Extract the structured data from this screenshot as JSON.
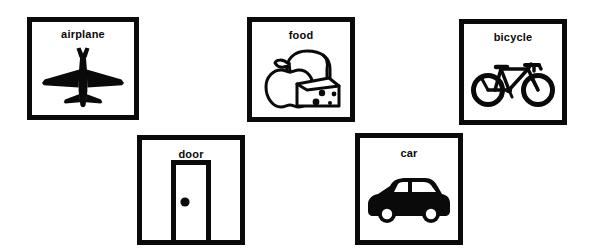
{
  "page": {
    "background_color": "#ffffff",
    "ink_color": "#0a0a0a"
  },
  "cards": [
    {
      "id": "airplane",
      "label": "airplane",
      "icon_name": "airplane-icon",
      "icon_style": "solid-silhouette",
      "row": 1,
      "column": 1
    },
    {
      "id": "food",
      "label": "food",
      "icon_name": "food-icon",
      "icon_style": "outline-apple-bread-cheese",
      "row": 1,
      "column": 2
    },
    {
      "id": "bicycle",
      "label": "bicycle",
      "icon_name": "bicycle-icon",
      "icon_style": "outline-line-drawing",
      "row": 1,
      "column": 3
    },
    {
      "id": "door",
      "label": "door",
      "icon_name": "door-icon",
      "icon_style": "outline-frame-with-knob",
      "row": 2,
      "column": 1
    },
    {
      "id": "car",
      "label": "car",
      "icon_name": "car-icon",
      "icon_style": "solid-silhouette",
      "row": 2,
      "column": 2
    }
  ]
}
